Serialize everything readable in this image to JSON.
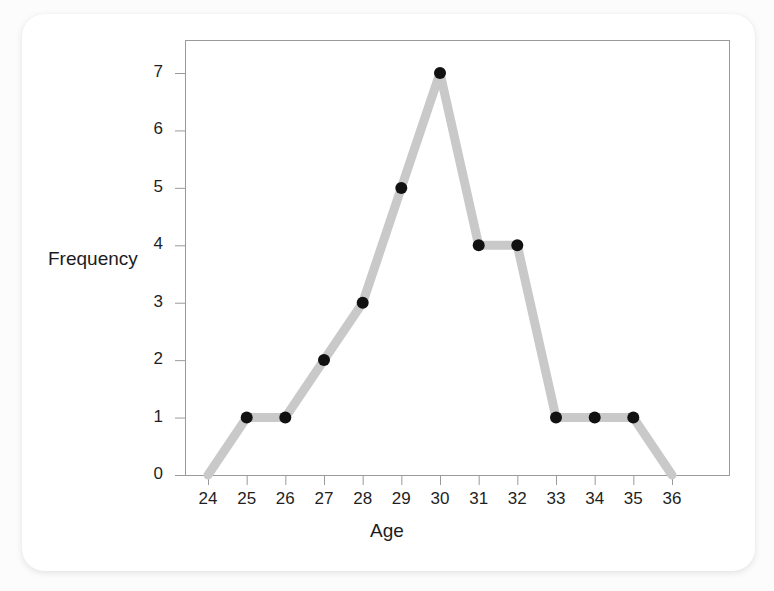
{
  "figure": {
    "background_color": "#fcfcfc",
    "card_color": "#ffffff",
    "bleed_text": [
      "the data set and the shape of the distribution of ages",
      "in the sample can be seen more clearly when the",
      "frequencies are plotted against the ages as a polygon.",
      "Each point is placed above the value it represents and",
      "the points are joined with straight line segments which",
      "are extended down to the horizontal axis at both ends."
    ]
  },
  "chart_data": {
    "type": "line",
    "title": "",
    "xlabel": "Age",
    "ylabel": "Frequency",
    "x": [
      24,
      25,
      26,
      27,
      28,
      29,
      30,
      31,
      32,
      33,
      34,
      35,
      36
    ],
    "values": [
      0,
      1,
      1,
      2,
      3,
      5,
      7,
      4,
      4,
      1,
      1,
      1,
      0
    ],
    "xtick_labels": [
      "24",
      "25",
      "26",
      "27",
      "28",
      "29",
      "30",
      "31",
      "32",
      "33",
      "34",
      "35",
      "36"
    ],
    "ytick_labels": [
      "0",
      "1",
      "2",
      "3",
      "4",
      "5",
      "6",
      "7"
    ],
    "yticks": [
      0,
      1,
      2,
      3,
      4,
      5,
      6,
      7
    ],
    "xlim": [
      24,
      36
    ],
    "ylim": [
      0,
      7
    ],
    "grid": false,
    "legend": null,
    "markers": {
      "shown_at_x": [
        25,
        26,
        27,
        28,
        29,
        30,
        31,
        32,
        33,
        34,
        35
      ],
      "shown_values": [
        1,
        1,
        2,
        3,
        5,
        7,
        4,
        4,
        1,
        1,
        1
      ],
      "shape": "circle",
      "color": "#111111",
      "size_px": 12
    },
    "line": {
      "color": "#c9c9c9",
      "width_px": 9
    },
    "axis_color": "#9a9a9a",
    "frame": true
  }
}
